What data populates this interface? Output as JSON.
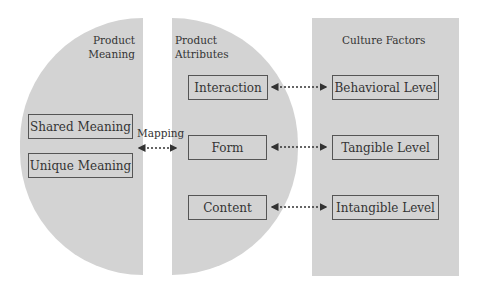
{
  "groups": {
    "product_meaning": {
      "title_line1": "Product",
      "title_line2": "Meaning",
      "items": [
        "Shared Meaning",
        "Unique Meaning"
      ]
    },
    "product_attributes": {
      "title_line1": "Product",
      "title_line2": "Attributes",
      "items": [
        "Interaction",
        "Form",
        "Content"
      ]
    },
    "culture_factors": {
      "title": "Culture Factors",
      "items": [
        "Behavioral Level",
        "Tangible Level",
        "Intangible Level"
      ]
    }
  },
  "connectors": {
    "mapping_label": "Mapping"
  },
  "colors": {
    "fill": "#d3d3d3",
    "border": "#555555",
    "text": "#333333"
  }
}
